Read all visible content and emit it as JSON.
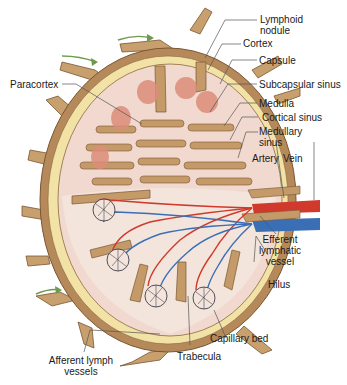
{
  "labels": {
    "lymphoid_nodule": "Lymphoid\nnodule",
    "lymphoid_nodule_l1": "Lymphoid",
    "lymphoid_nodule_l2": "nodule",
    "cortex": "Cortex",
    "capsule": "Capsule",
    "subcapsular_sinus": "Subcapsular sinus",
    "paracortex": "Paracortex",
    "medulla": "Medulla",
    "cortical_sinus": "Cortical sinus",
    "medullary_sinus_l1": "Medullary",
    "medullary_sinus_l2": "sinus",
    "artery": "Artery",
    "vein": "Vein",
    "efferent_l1": "Efferent",
    "efferent_l2": "lymphatic",
    "efferent_l3": "vessel",
    "hilus": "Hilus",
    "capillary_bed": "Capillary bed",
    "trabecula": "Trabecula",
    "afferent_l1": "Afferent lymph",
    "afferent_l2": "vessels"
  },
  "colors": {
    "capsule": "#b5895a",
    "capsule_dark": "#7a5632",
    "sinus": "#f3e2a6",
    "cortex": "#f1d9cf",
    "nodule": "#dd8c7a",
    "medulla_cords": "#c49a68",
    "artery": "#d0392b",
    "vein": "#3a6fb5",
    "arrow": "#6f9a4e",
    "leader": "#555555"
  }
}
